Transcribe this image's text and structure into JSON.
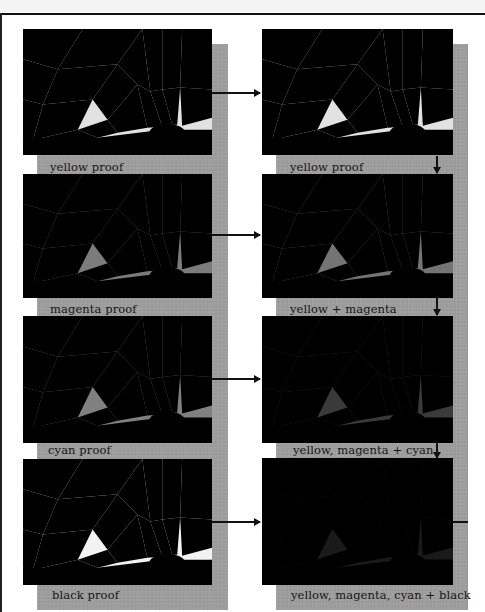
{
  "columns": {
    "left": {
      "heading": "individual proofs",
      "items": [
        {
          "label": "yellow proof",
          "tone": "yellow"
        },
        {
          "label": "magenta proof",
          "tone": "magenta"
        },
        {
          "label": "cyan proof",
          "tone": "cyan"
        },
        {
          "label": "black proof",
          "tone": "black"
        }
      ]
    },
    "right": {
      "heading": "progressive proofs",
      "items": [
        {
          "label": "yellow proof",
          "tone": "p1"
        },
        {
          "label": "yellow + magenta",
          "tone": "p2"
        },
        {
          "label": "yellow, magenta + cyan",
          "tone": "p3"
        },
        {
          "label": "yellow, magenta, cyan + black",
          "tone": "p4"
        }
      ]
    }
  },
  "arrows": {
    "horizontal": [
      "row-1",
      "row-2",
      "row-3",
      "row-4"
    ],
    "vertical": [
      "p1-to-p2",
      "p2-to-p3",
      "p3-to-p4"
    ]
  },
  "colors": {
    "strip": "#9c9c9c",
    "frame": "#111111"
  }
}
